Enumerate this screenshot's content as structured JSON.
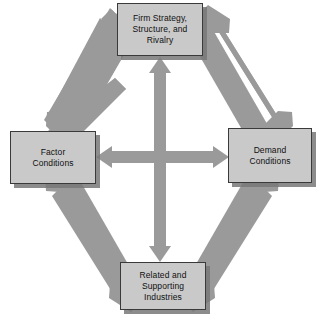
{
  "diagram": {
    "type": "diamond-framework",
    "background_color": "#ffffff",
    "node_fill_color": "#c9c9c9",
    "node_border_color": "#3a3a3a",
    "arrow_color": "#9a9a9a",
    "shadow_color": "#787878",
    "nodes": [
      {
        "id": "firm-strategy",
        "label": "Firm Strategy,\nStructure, and\nRivalry",
        "position": "top"
      },
      {
        "id": "factor-conditions",
        "label": "Factor\nConditions",
        "position": "left"
      },
      {
        "id": "demand-conditions",
        "label": "Demand\nConditions",
        "position": "right"
      },
      {
        "id": "related-supporting",
        "label": "Related and\nSupporting\nIndustries",
        "position": "bottom"
      }
    ],
    "connectors": [
      {
        "id": "firm-strategy-to-factor-conditions",
        "from": "firm-strategy",
        "to": "factor-conditions",
        "style": "double-headed",
        "orientation": "diagonal-upper-left"
      },
      {
        "id": "firm-strategy-to-demand-conditions",
        "from": "firm-strategy",
        "to": "demand-conditions",
        "style": "double-headed",
        "orientation": "diagonal-upper-right"
      },
      {
        "id": "factor-conditions-to-related-supporting",
        "from": "factor-conditions",
        "to": "related-supporting",
        "style": "double-headed",
        "orientation": "diagonal-lower-left"
      },
      {
        "id": "demand-conditions-to-related-supporting",
        "from": "demand-conditions",
        "to": "related-supporting",
        "style": "double-headed",
        "orientation": "diagonal-lower-right"
      },
      {
        "id": "factor-conditions-to-demand-conditions",
        "from": "factor-conditions",
        "to": "demand-conditions",
        "style": "double-headed",
        "orientation": "horizontal"
      },
      {
        "id": "firm-strategy-to-related-supporting",
        "from": "firm-strategy",
        "to": "related-supporting",
        "style": "double-headed",
        "orientation": "vertical"
      }
    ]
  }
}
